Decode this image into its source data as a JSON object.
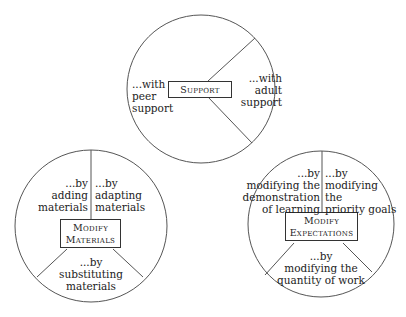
{
  "diagram": {
    "circles": [
      {
        "id": "support",
        "center_label": "Support",
        "segments": [
          {
            "lines": [
              "...with",
              "peer",
              "support"
            ]
          },
          {
            "lines": [
              "...with",
              "adult",
              "support"
            ]
          }
        ]
      },
      {
        "id": "modify-materials",
        "center_label_lines": [
          "Modify",
          "Materials"
        ],
        "segments": [
          {
            "lines": [
              "...by",
              "adding",
              "materials"
            ]
          },
          {
            "lines": [
              "...by",
              "adapting",
              "materials"
            ]
          },
          {
            "lines": [
              "...by",
              "substituting",
              "materials"
            ]
          }
        ]
      },
      {
        "id": "modify-expectations",
        "center_label_lines": [
          "Modify",
          "Expectations"
        ],
        "segments": [
          {
            "lines": [
              "...by",
              "modifying the",
              "demonstration",
              "of learning"
            ]
          },
          {
            "lines": [
              "...by",
              "modifying",
              "the",
              "priority goals"
            ]
          },
          {
            "lines": [
              "...by",
              "modifying the",
              "quantity of work"
            ]
          }
        ]
      }
    ],
    "colors": {
      "stroke": "#555555",
      "text": "#222222",
      "background": "#ffffff"
    }
  }
}
